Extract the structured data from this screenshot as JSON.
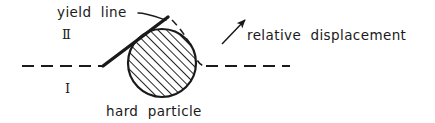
{
  "figure": {
    "name": "yield-line-hard-particle-diagram",
    "background_color": "#ffffff",
    "ink_color": "#1a1a1a",
    "width": 435,
    "height": 123
  },
  "labels": {
    "yield_line": "yield  line",
    "region_upper": "Ⅱ",
    "region_lower": "Ⅰ",
    "hard_particle": "hard  particle",
    "relative_displacement": "relative  displacement"
  },
  "elements": {
    "particle": {
      "name": "hard-particle-circle",
      "center_x": 162,
      "center_y": 63,
      "radius": 34,
      "fill": "hatched-45-degree",
      "stroke": "#1a1a1a"
    },
    "yield_line": {
      "name": "yield-line-path",
      "stroke": "#1a1a1a",
      "stroke_width": 3.2,
      "points": "103,66 168,17"
    },
    "reference_line_left": {
      "name": "reference-dashed-line-left",
      "stroke": "#1a1a1a",
      "dashed": true,
      "x1": 22,
      "y1": 66,
      "x2": 104,
      "y2": 66
    },
    "reference_line_right": {
      "name": "reference-dashed-line-right",
      "stroke": "#1a1a1a",
      "dashed": true,
      "x1": 206,
      "y1": 66,
      "x2": 290,
      "y2": 66
    },
    "particle_outline_dashed": {
      "name": "deformed-surface-dashed-curve",
      "stroke": "#1a1a1a",
      "dashed": true
    },
    "displacement_arrow": {
      "name": "relative-displacement-arrow",
      "stroke": "#1a1a1a",
      "x1": 222,
      "y1": 43,
      "x2": 247,
      "y2": 19,
      "direction": "up-right"
    },
    "leader_line": {
      "name": "yield-line-leader",
      "stroke": "#1a1a1a",
      "x1": 139,
      "y1": 14,
      "x2": 166,
      "y2": 20
    }
  }
}
